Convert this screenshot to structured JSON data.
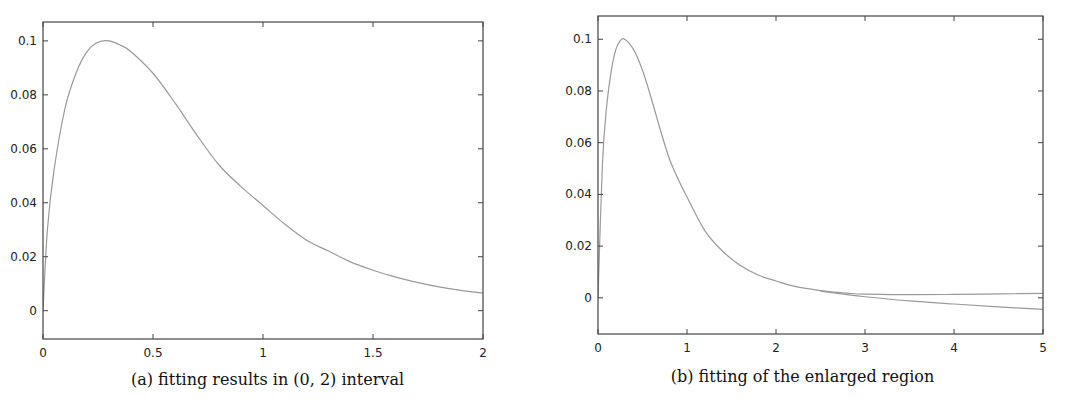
{
  "chart_data": [
    {
      "id": "a",
      "type": "line",
      "title": "",
      "caption": "(a) fitting results in (0, 2) interval",
      "xlabel": "",
      "ylabel": "",
      "xlim": [
        0,
        2
      ],
      "ylim": [
        -0.0105,
        0.107
      ],
      "grid": false,
      "legend": null,
      "x_ticks": [
        0,
        0.5,
        1,
        1.5,
        2
      ],
      "x_tick_labels": [
        "0",
        "0.5",
        "1",
        "1.5",
        "2"
      ],
      "y_ticks": [
        0,
        0.02,
        0.04,
        0.06,
        0.08,
        0.1
      ],
      "y_tick_labels": [
        "0",
        "0.02",
        "0.04",
        "0.06",
        "0.08",
        "0.1"
      ],
      "line_color": "#9a9a9a",
      "series": [
        {
          "name": "fit",
          "x": [
            0,
            0.02,
            0.05,
            0.1,
            0.15,
            0.2,
            0.25,
            0.3,
            0.35,
            0.4,
            0.5,
            0.6,
            0.7,
            0.8,
            0.9,
            1.0,
            1.1,
            1.2,
            1.3,
            1.4,
            1.5,
            1.6,
            1.7,
            1.8,
            1.9,
            2.0
          ],
          "y": [
            0.0,
            0.03,
            0.052,
            0.075,
            0.088,
            0.096,
            0.0995,
            0.1,
            0.0985,
            0.096,
            0.088,
            0.077,
            0.065,
            0.054,
            0.046,
            0.039,
            0.032,
            0.026,
            0.022,
            0.018,
            0.015,
            0.0125,
            0.0105,
            0.0088,
            0.0075,
            0.0065
          ]
        }
      ]
    },
    {
      "id": "b",
      "type": "line",
      "title": "",
      "caption": "(b) fitting of the enlarged region",
      "xlabel": "",
      "ylabel": "",
      "xlim": [
        0,
        5
      ],
      "ylim": [
        -0.014,
        0.109
      ],
      "grid": false,
      "legend": null,
      "x_ticks": [
        0,
        1,
        2,
        3,
        4,
        5
      ],
      "x_tick_labels": [
        "0",
        "1",
        "2",
        "3",
        "4",
        "5"
      ],
      "y_ticks": [
        0,
        0.02,
        0.04,
        0.06,
        0.08,
        0.1
      ],
      "y_tick_labels": [
        "0",
        "0.02",
        "0.04",
        "0.06",
        "0.08",
        "0.1"
      ],
      "line_color": "#9a9a9a",
      "series": [
        {
          "name": "original",
          "x": [
            0,
            0.05,
            0.1,
            0.15,
            0.2,
            0.25,
            0.3,
            0.4,
            0.5,
            0.6,
            0.7,
            0.8,
            0.9,
            1.0,
            1.2,
            1.4,
            1.6,
            1.8,
            2.0,
            2.2,
            2.5,
            2.8,
            3.0,
            3.5,
            4.0,
            4.5,
            5.0
          ],
          "y": [
            0.0,
            0.052,
            0.075,
            0.088,
            0.096,
            0.0995,
            0.1,
            0.096,
            0.088,
            0.077,
            0.065,
            0.054,
            0.046,
            0.039,
            0.026,
            0.018,
            0.0125,
            0.0088,
            0.0065,
            0.0045,
            0.0028,
            0.0018,
            0.0014,
            0.0012,
            0.0013,
            0.0015,
            0.0017
          ]
        },
        {
          "name": "fit-extrapolated",
          "x": [
            2.5,
            2.8,
            3.0,
            3.5,
            4.0,
            4.5,
            5.0
          ],
          "y": [
            0.0026,
            0.0012,
            0.0004,
            -0.0012,
            -0.0024,
            -0.0035,
            -0.0045
          ]
        }
      ]
    }
  ],
  "figures": {
    "a": {
      "caption": "(a) fitting results in (0, 2) interval"
    },
    "b": {
      "caption": "(b) fitting of the enlarged region"
    }
  }
}
